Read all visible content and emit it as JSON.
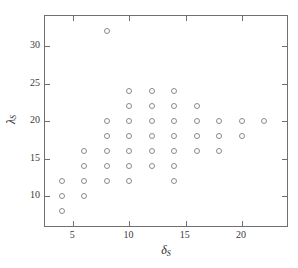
{
  "chart_data": {
    "type": "scatter",
    "title": "",
    "xlabel": "δ_S",
    "ylabel": "λ_S",
    "xlabel_base": "δ",
    "xlabel_sub": "S",
    "ylabel_base": "λ",
    "ylabel_sub": "S",
    "xlim": [
      2.5,
      24.0
    ],
    "ylim": [
      6.0,
      34.0
    ],
    "xticks": [
      5,
      10,
      15,
      20
    ],
    "yticks": [
      10,
      15,
      20,
      25,
      30
    ],
    "xtick_labels": [
      "5",
      "10",
      "15",
      "20"
    ],
    "ytick_labels": [
      "10",
      "15",
      "20",
      "25",
      "30"
    ],
    "grid": false,
    "legend": null,
    "marker": "open-circle",
    "marker_color": "#8a8a8a",
    "frame_color": "#6f6f6f",
    "background": "#ffffff",
    "points": [
      {
        "x": 4,
        "y": 12
      },
      {
        "x": 4,
        "y": 10
      },
      {
        "x": 4,
        "y": 8
      },
      {
        "x": 6,
        "y": 16
      },
      {
        "x": 6,
        "y": 14
      },
      {
        "x": 6,
        "y": 12
      },
      {
        "x": 6,
        "y": 10
      },
      {
        "x": 8,
        "y": 32
      },
      {
        "x": 8,
        "y": 20
      },
      {
        "x": 8,
        "y": 18
      },
      {
        "x": 8,
        "y": 16
      },
      {
        "x": 8,
        "y": 14
      },
      {
        "x": 8,
        "y": 12
      },
      {
        "x": 10,
        "y": 24
      },
      {
        "x": 10,
        "y": 22
      },
      {
        "x": 10,
        "y": 20
      },
      {
        "x": 10,
        "y": 18
      },
      {
        "x": 10,
        "y": 16
      },
      {
        "x": 10,
        "y": 14
      },
      {
        "x": 10,
        "y": 12
      },
      {
        "x": 12,
        "y": 24
      },
      {
        "x": 12,
        "y": 22
      },
      {
        "x": 12,
        "y": 20
      },
      {
        "x": 12,
        "y": 18
      },
      {
        "x": 12,
        "y": 16
      },
      {
        "x": 12,
        "y": 14
      },
      {
        "x": 14,
        "y": 24
      },
      {
        "x": 14,
        "y": 22
      },
      {
        "x": 14,
        "y": 20
      },
      {
        "x": 14,
        "y": 18
      },
      {
        "x": 14,
        "y": 16
      },
      {
        "x": 14,
        "y": 14
      },
      {
        "x": 14,
        "y": 12
      },
      {
        "x": 16,
        "y": 22
      },
      {
        "x": 16,
        "y": 20
      },
      {
        "x": 16,
        "y": 18
      },
      {
        "x": 16,
        "y": 16
      },
      {
        "x": 18,
        "y": 20
      },
      {
        "x": 18,
        "y": 18
      },
      {
        "x": 18,
        "y": 16
      },
      {
        "x": 20,
        "y": 20
      },
      {
        "x": 20,
        "y": 18
      },
      {
        "x": 22,
        "y": 20
      }
    ]
  }
}
